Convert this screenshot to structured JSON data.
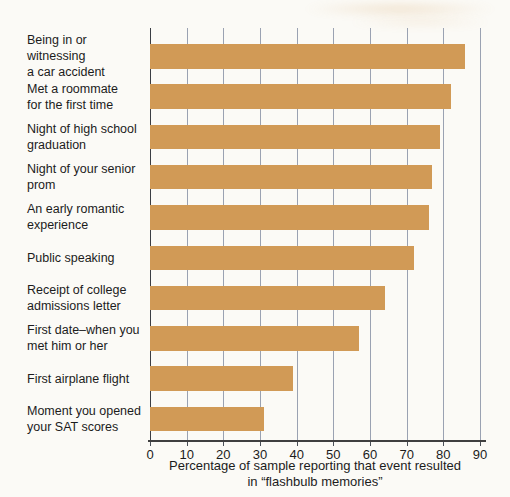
{
  "chart_data": {
    "type": "bar",
    "orientation": "horizontal",
    "categories": [
      "Being in or witnessing\na car accident",
      "Met a roommate\nfor the first time",
      "Night of high school\ngraduation",
      "Night of your senior\nprom",
      "An early romantic\nexperience",
      "Public speaking",
      "Receipt of college\nadmissions letter",
      "First date–when you\nmet him or her",
      "First airplane flight",
      "Moment you opened\nyour SAT scores"
    ],
    "values": [
      86,
      82,
      79,
      77,
      76,
      72,
      64,
      57,
      39,
      31
    ],
    "title": "",
    "xlabel": "Percentage of sample reporting that event resulted in “flashbulb memories”",
    "xlabel_lines": [
      "Percentage of sample reporting that event resulted",
      "in “flashbulb memories”"
    ],
    "x_ticks": [
      0,
      10,
      20,
      30,
      40,
      50,
      60,
      70,
      80,
      90
    ],
    "xlim": [
      0,
      90
    ],
    "grid": true,
    "legend": "none",
    "bar_color": "#d19a56",
    "gridline_color": "#9aa2b2",
    "zero_line_color": "#3a3d44",
    "axis_color": "#3f3f3f",
    "tick_color": "#4a4f58",
    "text_color": "#1c1c1c"
  }
}
